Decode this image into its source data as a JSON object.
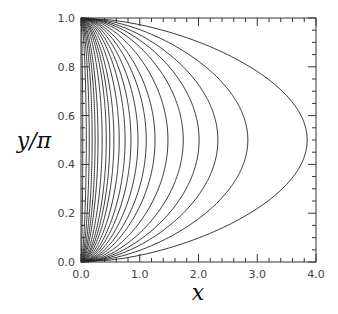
{
  "chart_data": {
    "type": "line",
    "title": "",
    "xlabel": "x",
    "ylabel": "y/π",
    "xlim": [
      0.0,
      4.0
    ],
    "ylim": [
      0.0,
      1.0
    ],
    "grid": false,
    "legend": "none",
    "x_ticks": [
      "0.0",
      "1.0",
      "2.0",
      "3.0",
      "4.0"
    ],
    "y_ticks": [
      "0.0",
      "0.2",
      "0.4",
      "0.6",
      "0.8",
      "1.0"
    ],
    "x_minor_step": 0.2,
    "y_minor_step": 0.05,
    "series": [
      {
        "name": "contour-1",
        "x_max": 0.03
      },
      {
        "name": "contour-2",
        "x_max": 0.09
      },
      {
        "name": "contour-3",
        "x_max": 0.14
      },
      {
        "name": "contour-4",
        "x_max": 0.19
      },
      {
        "name": "contour-5",
        "x_max": 0.24
      },
      {
        "name": "contour-6",
        "x_max": 0.29
      },
      {
        "name": "contour-7",
        "x_max": 0.36
      },
      {
        "name": "contour-8",
        "x_max": 0.43
      },
      {
        "name": "contour-9",
        "x_max": 0.49
      },
      {
        "name": "contour-10",
        "x_max": 0.56
      },
      {
        "name": "contour-11",
        "x_max": 0.65
      },
      {
        "name": "contour-12",
        "x_max": 0.75
      },
      {
        "name": "contour-13",
        "x_max": 0.85
      },
      {
        "name": "contour-14",
        "x_max": 0.97
      },
      {
        "name": "contour-15",
        "x_max": 1.11
      },
      {
        "name": "contour-16",
        "x_max": 1.26
      },
      {
        "name": "contour-17",
        "x_max": 1.48
      },
      {
        "name": "contour-18",
        "x_max": 1.74
      },
      {
        "name": "contour-19",
        "x_max": 2.01
      },
      {
        "name": "contour-20",
        "x_max": 2.33
      },
      {
        "name": "contour-21",
        "x_max": 2.84
      },
      {
        "name": "contour-22",
        "x_max": 3.85
      }
    ]
  },
  "colors": {
    "line": "#222222",
    "frame": "#333333",
    "background": "#ffffff"
  }
}
